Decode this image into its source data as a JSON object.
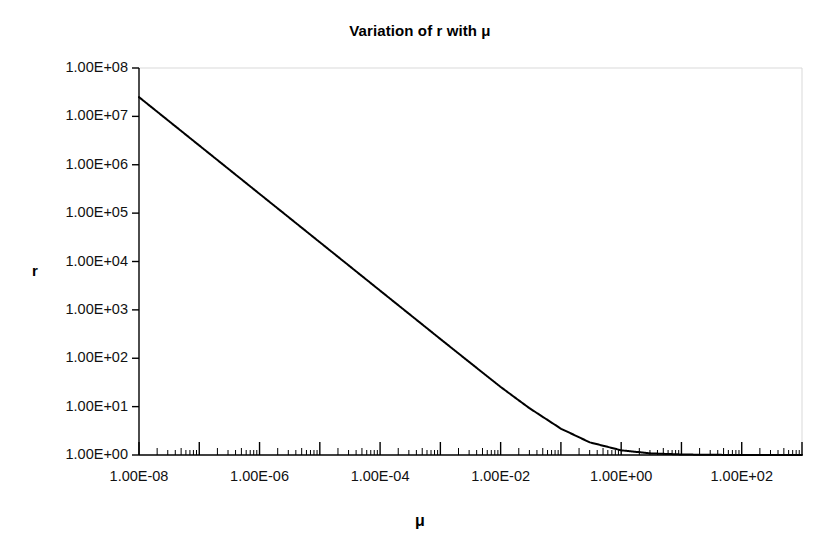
{
  "chart_data": {
    "type": "line",
    "title": "Variation of r with μ",
    "xlabel": "μ",
    "ylabel": "r",
    "xscale": "log",
    "yscale": "log",
    "xlim": [
      1e-08,
      1000
    ],
    "ylim": [
      1,
      100000000
    ],
    "grid": false,
    "legend": null,
    "x_tick_labels": [
      "1.00E-08",
      "1.00E-06",
      "1.00E-04",
      "1.00E-02",
      "1.00E+00",
      "1.00E+02"
    ],
    "x_tick_values": [
      1e-08,
      1e-06,
      0.0001,
      0.01,
      1,
      100
    ],
    "y_tick_labels": [
      "1.00E+08",
      "1.00E+07",
      "1.00E+06",
      "1.00E+05",
      "1.00E+04",
      "1.00E+03",
      "1.00E+02",
      "1.00E+01",
      "1.00E+00"
    ],
    "y_tick_values": [
      100000000,
      10000000,
      1000000,
      100000,
      10000,
      1000,
      100,
      10,
      1
    ],
    "minor_ticks_x": true,
    "minor_ticks_y": false,
    "series": [
      {
        "name": "r",
        "color": "#000000",
        "line_width": 2,
        "x": [
          1e-08,
          3e-08,
          1e-07,
          3e-07,
          1e-06,
          3e-06,
          1e-05,
          3e-05,
          0.0001,
          0.0003,
          0.001,
          0.003,
          0.01,
          0.03,
          0.1,
          0.3,
          1,
          3,
          10,
          30,
          100,
          300,
          1000
        ],
        "y": [
          25000000,
          8340000,
          2500000,
          834000,
          250000,
          83400,
          25000,
          8340,
          2500,
          834,
          250,
          84,
          25.5,
          9.3,
          3.5,
          1.83,
          1.25,
          1.083,
          1.025,
          1.008,
          1.0025,
          1.0008,
          1.0003
        ]
      }
    ],
    "annotations": []
  },
  "axes": {
    "plot_left_x": 139,
    "plot_right_x": 802,
    "plot_top_y": 68,
    "plot_bottom_y": 455,
    "frame_color": "#d9d9d9",
    "axis_color": "#000000"
  }
}
